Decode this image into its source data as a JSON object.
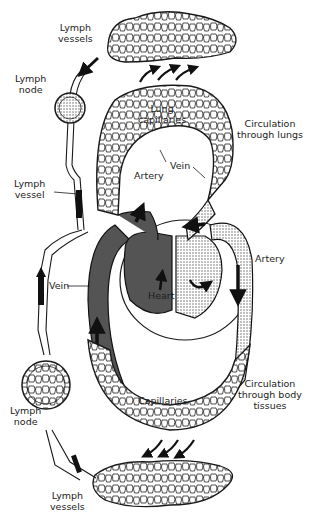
{
  "diagram": {
    "colors": {
      "ink": "#1a1a1a",
      "stipple": "#6a6a6a",
      "paper": "#ffffff"
    },
    "labels": {
      "lymph_vessels_top": [
        "Lymph",
        "vessels"
      ],
      "lymph_node_top": [
        "Lymph",
        "node"
      ],
      "lung_capillaries": [
        "Lung",
        "capillaries"
      ],
      "circulation_lungs": [
        "Circulation",
        "through lungs"
      ],
      "lymph_vessel_mid": [
        "Lymph",
        "vessel"
      ],
      "artery_upper": "Artery",
      "vein_upper": "Vein",
      "artery_right": "Artery",
      "vein_left": "Vein",
      "heart": "Heart",
      "capillaries": "Capillaries",
      "circulation_body": [
        "Circulation",
        "through body",
        "tissues"
      ],
      "lymph_node_bottom": [
        "Lymph",
        "node"
      ],
      "lymph_vessels_bottom": [
        "Lymph",
        "vessels"
      ]
    }
  }
}
